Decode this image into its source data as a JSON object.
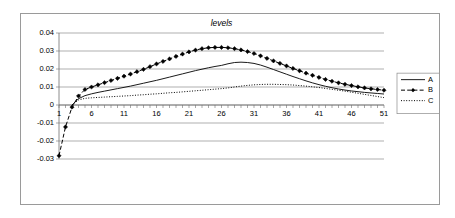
{
  "chart_data": {
    "type": "line",
    "title": "levels",
    "xlabel": "",
    "ylabel": "",
    "xlim": [
      1,
      51
    ],
    "ylim": [
      -0.03,
      0.04
    ],
    "grid": true,
    "legend_position": "right",
    "y_ticks": [
      0.04,
      0.03,
      0.02,
      0.01,
      0,
      -0.01,
      -0.02,
      -0.03
    ],
    "y_tick_labels": [
      "0.04",
      "0.03",
      "0.02",
      "0.01",
      "0",
      "-0.01",
      "-0.02",
      "-0.03"
    ],
    "x_ticks": [
      1,
      6,
      11,
      16,
      21,
      26,
      31,
      36,
      41,
      46,
      51
    ],
    "x_tick_labels": [
      "1",
      "6",
      "11",
      "16",
      "21",
      "26",
      "31",
      "36",
      "41",
      "46",
      "51"
    ],
    "x": [
      1,
      2,
      3,
      4,
      5,
      6,
      7,
      8,
      9,
      10,
      11,
      12,
      13,
      14,
      15,
      16,
      17,
      18,
      19,
      20,
      21,
      22,
      23,
      24,
      25,
      26,
      27,
      28,
      29,
      30,
      31,
      32,
      33,
      34,
      35,
      36,
      37,
      38,
      39,
      40,
      41,
      42,
      43,
      44,
      45,
      46,
      47,
      48,
      49,
      50,
      51
    ],
    "series": [
      {
        "name": "A",
        "style": "solid",
        "marker": "none",
        "values": [
          null,
          null,
          0.0,
          0.0035,
          0.0052,
          0.0062,
          0.007,
          0.0077,
          0.0084,
          0.0091,
          0.0098,
          0.0105,
          0.0113,
          0.0121,
          0.0129,
          0.0137,
          0.0146,
          0.0155,
          0.0164,
          0.0173,
          0.0182,
          0.0191,
          0.0199,
          0.0207,
          0.0214,
          0.022,
          0.0229,
          0.0236,
          0.0238,
          0.0236,
          0.0231,
          0.0222,
          0.021,
          0.0197,
          0.0184,
          0.0171,
          0.0158,
          0.0146,
          0.0134,
          0.0123,
          0.0113,
          0.0104,
          0.0096,
          0.0089,
          0.0083,
          0.0078,
          0.0074,
          0.007,
          0.0067,
          0.0064,
          0.0061
        ]
      },
      {
        "name": "B",
        "style": "dashed",
        "marker": "diamond",
        "values": [
          -0.0282,
          -0.0122,
          -0.0012,
          0.005,
          0.0086,
          0.01,
          0.0112,
          0.0124,
          0.0136,
          0.0148,
          0.016,
          0.0172,
          0.0185,
          0.0198,
          0.0213,
          0.0228,
          0.0242,
          0.0256,
          0.027,
          0.0283,
          0.0295,
          0.0305,
          0.0313,
          0.0318,
          0.032,
          0.032,
          0.0318,
          0.0313,
          0.0306,
          0.0297,
          0.0286,
          0.0273,
          0.0259,
          0.0245,
          0.0231,
          0.0217,
          0.0203,
          0.019,
          0.0177,
          0.0165,
          0.0153,
          0.0142,
          0.0132,
          0.0123,
          0.0115,
          0.0108,
          0.0101,
          0.0095,
          0.009,
          0.0086,
          0.0082
        ]
      },
      {
        "name": "C",
        "style": "dotted",
        "marker": "none",
        "values": [
          null,
          null,
          0.0,
          0.0028,
          0.0037,
          0.004,
          0.0042,
          0.0044,
          0.0046,
          0.0048,
          0.005,
          0.0052,
          0.0055,
          0.0057,
          0.006,
          0.0062,
          0.0065,
          0.0068,
          0.007,
          0.0073,
          0.0076,
          0.0079,
          0.0082,
          0.0085,
          0.0088,
          0.0091,
          0.0095,
          0.01,
          0.0105,
          0.0109,
          0.0112,
          0.0114,
          0.0115,
          0.0115,
          0.0114,
          0.0113,
          0.0111,
          0.0108,
          0.0105,
          0.0101,
          0.0097,
          0.0092,
          0.0087,
          0.0082,
          0.0077,
          0.0071,
          0.0065,
          0.0059,
          0.0053,
          0.0047,
          0.0041
        ]
      }
    ],
    "legend": [
      {
        "label": "A",
        "style": "solid",
        "marker": "none"
      },
      {
        "label": "B",
        "style": "dashed",
        "marker": "diamond"
      },
      {
        "label": "C",
        "style": "dotted",
        "marker": "none"
      }
    ]
  }
}
